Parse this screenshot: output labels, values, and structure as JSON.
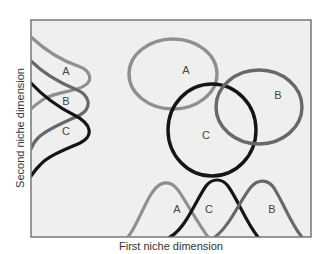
{
  "diagram": {
    "title": "",
    "x_axis_label": "First niche dimension",
    "y_axis_label": "Second niche dimension",
    "colors": {
      "species_A": "#8f8f8f",
      "species_B": "#686868",
      "species_C": "#151515",
      "frame": "#555555",
      "background": "#efefef"
    },
    "niches": [
      {
        "species": "A",
        "label": "A",
        "shape": "ellipse"
      },
      {
        "species": "B",
        "label": "B",
        "shape": "ellipse"
      },
      {
        "species": "C",
        "label": "C",
        "shape": "ellipse"
      }
    ],
    "x_distributions": [
      {
        "species": "A",
        "label": "A"
      },
      {
        "species": "C",
        "label": "C"
      },
      {
        "species": "B",
        "label": "B"
      }
    ],
    "y_distributions": [
      {
        "species": "A",
        "label": "A"
      },
      {
        "species": "B",
        "label": "B"
      },
      {
        "species": "C",
        "label": "C"
      }
    ]
  }
}
